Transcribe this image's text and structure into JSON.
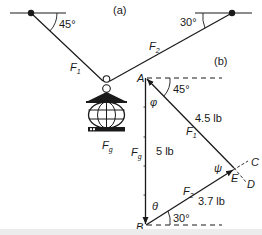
{
  "figure": {
    "part_a_label": "(a)",
    "part_b_label": "(b)",
    "part_a": {
      "left_angle": "45°",
      "right_angle": "30°",
      "force_left": {
        "symbol": "F",
        "subscript": "1"
      },
      "force_right": {
        "symbol": "F",
        "subscript": "2"
      },
      "weight": {
        "symbol": "F",
        "subscript": "g"
      }
    },
    "part_b": {
      "points": {
        "A": "A",
        "B": "B",
        "C": "C",
        "D": "D",
        "E": "E"
      },
      "angle_top": "45°",
      "angle_bottom": "30°",
      "phi": "φ",
      "theta": "θ",
      "psi": "ψ",
      "weight": {
        "symbol": "F",
        "subscript": "g",
        "magnitude": "5 lb"
      },
      "f1": {
        "symbol": "F",
        "subscript": "1",
        "magnitude": "4.5 lb"
      },
      "f2": {
        "symbol": "F",
        "subscript": "2",
        "magnitude": "3.7 lb"
      }
    }
  }
}
